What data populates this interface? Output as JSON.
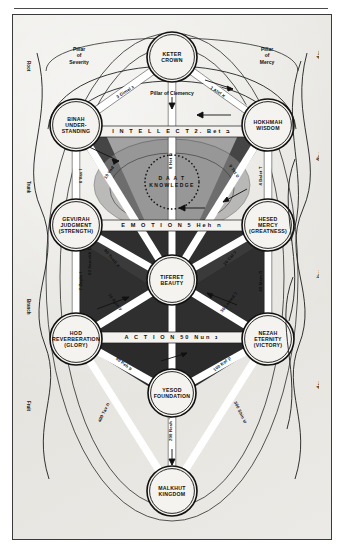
{
  "diagram": {
    "background_color": "#e9e8e4",
    "ink_color": "#111111"
  },
  "sefirot": [
    {
      "id": "keter",
      "line1": "KETER",
      "line2": "CROWN",
      "line3": "",
      "cx": 171,
      "cy": 48,
      "r": 25
    },
    {
      "id": "binah",
      "line1": "BINAH",
      "line2": "UNDER-",
      "line3": "STANDING",
      "cx": 75,
      "cy": 116,
      "r": 26
    },
    {
      "id": "hokhmah",
      "line1": "HOKHMAH",
      "line2": "WISDOM",
      "line3": "",
      "cx": 267,
      "cy": 116,
      "r": 26
    },
    {
      "id": "gevurah",
      "line1": "GEVURAH",
      "line2": "JUDGMENT",
      "line3": "(STRENGTH)",
      "cx": 75,
      "cy": 216,
      "r": 26
    },
    {
      "id": "hesed",
      "line1": "HESED",
      "line2": "MERCY",
      "line3": "(GREATNESS)",
      "cx": 267,
      "cy": 216,
      "r": 26
    },
    {
      "id": "tiferet",
      "line1": "TIFERET",
      "line2": "BEAUTY",
      "line3": "",
      "cx": 171,
      "cy": 271,
      "r": 25
    },
    {
      "id": "hod",
      "line1": "HOD",
      "line2": "REVERBERATION",
      "line3": "(GLORY)",
      "cx": 75,
      "cy": 330,
      "r": 26
    },
    {
      "id": "nezah",
      "line1": "NEZAH",
      "line2": "ETERNITY",
      "line3": "(VICTORY)",
      "cx": 267,
      "cy": 330,
      "r": 26
    },
    {
      "id": "yesod",
      "line1": "YESOD",
      "line2": "FOUNDATION",
      "line3": "",
      "cx": 171,
      "cy": 384,
      "r": 24
    },
    {
      "id": "malkhut",
      "line1": "MALKHUT",
      "line2": "KINGDOM",
      "line3": "",
      "cx": 171,
      "cy": 482,
      "r": 25
    }
  ],
  "daat": {
    "line1": "D A A T",
    "line2": "KNOWLEDGE",
    "cx": 171,
    "cy": 171
  },
  "horizontal_bars": [
    {
      "id": "intellect",
      "text": "I N T E L L E C T    2. Bet ב",
      "cx": 171,
      "cy": 122
    },
    {
      "id": "emotion",
      "text": "E M O T I O N    5 Heh ה",
      "cx": 171,
      "cy": 216
    },
    {
      "id": "action",
      "text": "A C T I O N    50 Nun נ",
      "cx": 171,
      "cy": 328
    }
  ],
  "pillars": [
    {
      "id": "severity",
      "lines": [
        "Pillar",
        "of",
        "Severity"
      ],
      "x": 78,
      "y": 42
    },
    {
      "id": "clemency",
      "lines": [
        "Pillar of Clemency"
      ],
      "x": 171,
      "y": 86
    },
    {
      "id": "mercy",
      "lines": [
        "Pillar",
        "of",
        "Mercy"
      ],
      "x": 266,
      "y": 42
    }
  ],
  "paths": [
    {
      "id": "p1",
      "label": "1 Alef א",
      "x": 216,
      "y": 84,
      "rot": 33
    },
    {
      "id": "p3",
      "label": "3 Gimel ג",
      "x": 125,
      "y": 84,
      "rot": -33
    },
    {
      "id": "p8",
      "label": "8 Het ח",
      "x": 171,
      "y": 152,
      "rot": -90
    },
    {
      "id": "p6",
      "label": "6 Vav ו",
      "x": 81,
      "y": 167,
      "rot": -90
    },
    {
      "id": "p10",
      "label": "10 Yod י",
      "x": 110,
      "y": 163,
      "rot": -56
    },
    {
      "id": "p4",
      "label": "4 Dalet ד",
      "x": 261,
      "y": 167,
      "rot": -90
    },
    {
      "id": "p9",
      "label": "9 Tet ט",
      "x": 232,
      "y": 163,
      "rot": 56
    },
    {
      "id": "p7",
      "label": "7 Zayin ז",
      "x": 81,
      "y": 272,
      "rot": -90
    },
    {
      "id": "p70",
      "label": "70 Ayin ע",
      "x": 113,
      "y": 294,
      "rot": 52
    },
    {
      "id": "p40",
      "label": "40 Mem מ",
      "x": 261,
      "y": 272,
      "rot": -90
    },
    {
      "id": "p20",
      "label": "20 Caf כ",
      "x": 230,
      "y": 250,
      "rot": -50
    },
    {
      "id": "p30",
      "label": "30 Lamed ל",
      "x": 229,
      "y": 294,
      "rot": -52
    },
    {
      "id": "p90",
      "label": "90 Tsadi צ",
      "x": 110,
      "y": 250,
      "rot": 50
    },
    {
      "id": "p60",
      "label": "60 Samekh ס",
      "x": 90,
      "y": 252,
      "rot": -90
    },
    {
      "id": "p80",
      "label": "80 Peh פ",
      "x": 122,
      "y": 356,
      "rot": 38
    },
    {
      "id": "p100",
      "label": "100 Kof ק",
      "x": 222,
      "y": 356,
      "rot": -38
    },
    {
      "id": "p200",
      "label": "200 Resh ר",
      "x": 171,
      "y": 420,
      "rot": -90
    },
    {
      "id": "p400",
      "label": "400 Tav ת",
      "x": 104,
      "y": 404,
      "rot": -64
    },
    {
      "id": "p300",
      "label": "300 Shin ש",
      "x": 238,
      "y": 404,
      "rot": 64
    }
  ],
  "left_edge_labels": [
    {
      "id": "root",
      "text": "Root",
      "x": 26,
      "y": 52
    },
    {
      "id": "trunk",
      "text": "Trunk",
      "x": 26,
      "y": 172
    },
    {
      "id": "branch",
      "text": "Branch",
      "x": 26,
      "y": 290
    },
    {
      "id": "fruit",
      "text": "Fruit",
      "x": 26,
      "y": 392
    }
  ],
  "right_edge_labels": [
    {
      "id": "azilut",
      "text": "Azilut: Emanation",
      "x": 318,
      "y": 50
    },
    {
      "id": "beriah",
      "text": "Beriah: World of Creation",
      "x": 318,
      "y": 152
    },
    {
      "id": "yezirah",
      "text": "Yezirah: World of Formation",
      "x": 318,
      "y": 270
    },
    {
      "id": "asiyah",
      "text": "Asiyah: World of Action",
      "x": 318,
      "y": 380
    }
  ]
}
